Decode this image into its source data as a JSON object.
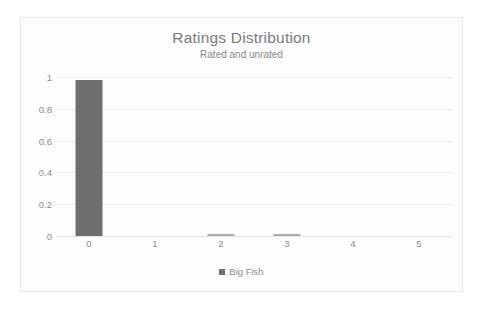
{
  "chart_data": {
    "type": "bar",
    "title": "Ratings Distribution",
    "subtitle": "Rated and unrated",
    "categories": [
      "0",
      "1",
      "2",
      "3",
      "4",
      "5"
    ],
    "series": [
      {
        "name": "Big Fish",
        "values": [
          0.98,
          0,
          0.01,
          0.01,
          0,
          0
        ],
        "color": "#6e6e6e"
      }
    ],
    "xlabel": "",
    "ylabel": "",
    "ylim": [
      0,
      1
    ],
    "y_ticks": [
      "0",
      "0.2",
      "0.4",
      "0.6",
      "0.8",
      "1"
    ],
    "y_tick_values": [
      0,
      0.2,
      0.4,
      0.6,
      0.8,
      1
    ],
    "grid": true,
    "legend_position": "bottom"
  },
  "legend": {
    "entries": [
      {
        "label": "Big Fish",
        "marker": "square-marker",
        "color": "#6e6e6e"
      }
    ]
  },
  "colors": {
    "bar": "#6e6e6e",
    "gridline": "#eeeeee",
    "text": "#8c8c8c",
    "title_text": "#7b7b7b",
    "frame_border": "#e9e9e9",
    "background": "#fdfdfd"
  }
}
